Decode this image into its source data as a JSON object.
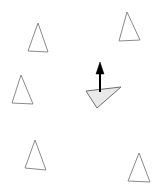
{
  "canvas": {
    "width": 162,
    "height": 189,
    "background_color": "#ffffff",
    "title": "multi-agent-triangle-scene"
  },
  "style": {
    "outline_stroke_color": "#8a8a8a",
    "outline_stroke_width": 1,
    "outline_fill": "none",
    "selected_stroke_color": "#6e6e6e",
    "selected_stroke_width": 1,
    "selected_fill_color": "#e9e9e9",
    "arrow_color": "#000000",
    "arrow_stroke_width": 2
  },
  "agents": [
    {
      "id": "agent-top-left",
      "label": "triangle-outline-top-left",
      "points": "38,23 48,52 28,51",
      "state": "idle"
    },
    {
      "id": "agent-top-right",
      "label": "triangle-outline-top-right",
      "points": "127,12 140,40 119,41",
      "state": "idle"
    },
    {
      "id": "agent-mid-left",
      "label": "triangle-outline-mid-left",
      "points": "21,75 33,104 12,103",
      "state": "idle"
    },
    {
      "id": "agent-bottom-left",
      "label": "triangle-outline-bottom-left",
      "points": "35,140 46,170 25,168",
      "state": "idle"
    },
    {
      "id": "agent-bottom-right",
      "label": "triangle-outline-bottom-right",
      "points": "139,153 150,182 128,181",
      "state": "idle"
    }
  ],
  "selected_agent": {
    "id": "agent-center-selected",
    "label": "triangle-filled-center-selected",
    "points": "86,91 121,87 97,108",
    "fill_color": "#e9e9e9",
    "state": "active"
  },
  "velocity_arrow": {
    "id": "velocity-arrow",
    "label": "velocity-vector-up",
    "shaft_x1": 100,
    "shaft_y1": 92,
    "shaft_x2": 100,
    "shaft_y2": 69,
    "head_points": "100,62 104,74 96,74",
    "direction": "up"
  }
}
